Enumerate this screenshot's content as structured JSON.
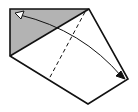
{
  "diagram": {
    "type": "origami-fold-step",
    "colors": {
      "background": "#ffffff",
      "paper_back": "#b3b3b3",
      "paper_front": "#ffffff",
      "line": "#111111"
    },
    "elements": [
      {
        "kind": "shaded-triangle",
        "meaning": "colored side of paper"
      },
      {
        "kind": "outline",
        "meaning": "paper edge"
      },
      {
        "kind": "diagonal-crease",
        "meaning": "existing fold edge"
      },
      {
        "kind": "valley-fold-line",
        "style": "dashed"
      },
      {
        "kind": "fold-arrow",
        "style": "double-headed curved arrow",
        "meaning": "fold and unfold"
      }
    ]
  }
}
